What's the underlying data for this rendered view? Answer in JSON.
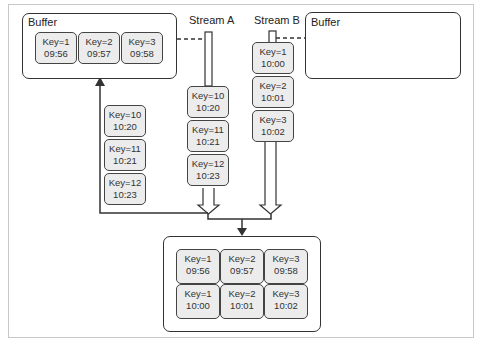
{
  "diagram": {
    "stream_a_label": "Stream A",
    "stream_b_label": "Stream B",
    "buffer_left": {
      "title": "Buffer",
      "records": [
        {
          "key": "Key=1",
          "time": "09:56"
        },
        {
          "key": "Key=2",
          "time": "09:57"
        },
        {
          "key": "Key=3",
          "time": "09:58"
        }
      ]
    },
    "buffer_right": {
      "title": "Buffer",
      "records": []
    },
    "stream_a_records": [
      {
        "key": "Key=10",
        "time": "10:20"
      },
      {
        "key": "Key=11",
        "time": "10:21"
      },
      {
        "key": "Key=12",
        "time": "10:23"
      }
    ],
    "stream_b_records": [
      {
        "key": "Key=1",
        "time": "10:00"
      },
      {
        "key": "Key=2",
        "time": "10:01"
      },
      {
        "key": "Key=3",
        "time": "10:02"
      }
    ],
    "buffered_from_a": [
      {
        "key": "Key=10",
        "time": "10:20"
      },
      {
        "key": "Key=11",
        "time": "10:21"
      },
      {
        "key": "Key=12",
        "time": "10:23"
      }
    ],
    "joined_output": {
      "top_row": [
        {
          "key": "Key=1",
          "time": "09:56"
        },
        {
          "key": "Key=2",
          "time": "09:57"
        },
        {
          "key": "Key=3",
          "time": "09:58"
        }
      ],
      "bottom_row": [
        {
          "key": "Key=1",
          "time": "10:00"
        },
        {
          "key": "Key=2",
          "time": "10:01"
        },
        {
          "key": "Key=3",
          "time": "10:02"
        }
      ]
    }
  }
}
